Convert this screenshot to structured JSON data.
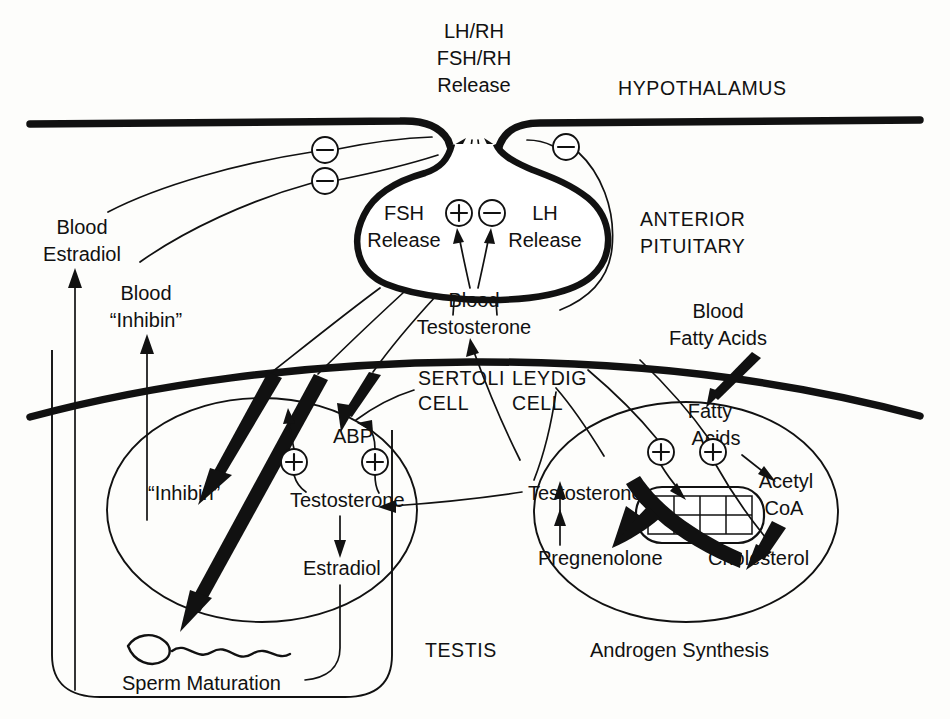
{
  "figure": {
    "caption_bottom_left": "Sperm Maturation",
    "caption_bottom_center": "TESTIS",
    "caption_bottom_right": "Androgen Synthesis"
  },
  "regions": {
    "hypothalamus": "HYPOTHALAMUS",
    "anterior_pituitary_line1": "ANTERIOR",
    "anterior_pituitary_line2": "PITUITARY",
    "sertoli_line1": "SERTOLI",
    "sertoli_line2": "CELL",
    "leydig_line1": "LEYDIG",
    "leydig_line2": "CELL",
    "testis": "TESTIS"
  },
  "hypothalamus_output": {
    "line1": "LH/RH",
    "line2": "FSH/RH",
    "line3": "Release"
  },
  "pituitary": {
    "fsh_line1": "FSH",
    "fsh_line2": "Release",
    "lh_line1": "LH",
    "lh_line2": "Release"
  },
  "blood": {
    "testosterone_line1": "Blood",
    "testosterone_line2": "Testosterone",
    "estradiol_line1": "Blood",
    "estradiol_line2": "Estradiol",
    "inhibin_line1": "Blood",
    "inhibin_line2": "“Inhibin”",
    "fatty_acids_line1": "Blood",
    "fatty_acids_line2": "Fatty Acids"
  },
  "sertoli_cell": {
    "inhibin": "“Inhibin”",
    "abp": "ABP",
    "testosterone": "Testosterone",
    "estradiol": "Estradiol",
    "sperm": "Sperm Maturation"
  },
  "leydig_cell": {
    "testosterone": "Testosterone",
    "pregnenolone": "Pregnenolone",
    "cholesterol": "Cholesterol",
    "fatty_acids_line1": "Fatty",
    "fatty_acids_line2": "Acids",
    "acetyl_line1": "Acetyl",
    "acetyl_line2": "CoA",
    "organelle": "mitochondrion",
    "caption": "Androgen Synthesis"
  },
  "signs": {
    "plus": "+",
    "minus": "−",
    "feedback_negative_count": 3,
    "stimulatory_positive_count": 3
  },
  "colors": {
    "ink": "#111111",
    "paper": "#fdfdfb"
  }
}
